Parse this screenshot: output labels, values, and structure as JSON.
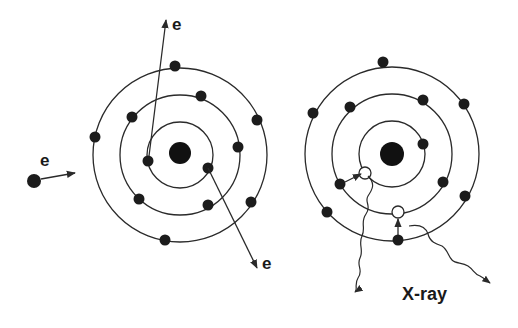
{
  "diagram": {
    "left_panel": {
      "description": "Electron ionization of inner-shell electron",
      "incident_electron_label": "e",
      "scattered_electron_label": "e",
      "ejected_electron_label": "e"
    },
    "right_panel": {
      "description": "Electron transitions filling vacancies emit X-ray",
      "emission_label": "X-ray"
    },
    "colors": {
      "line": "#2a2a2a",
      "electron": "#1c1c1c",
      "background": "#ffffff"
    }
  }
}
